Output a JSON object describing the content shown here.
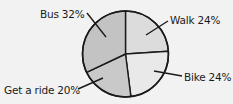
{
  "chart_data": {
    "type": "pie",
    "title": "",
    "categories": [
      "Walk",
      "Bike",
      "Get a ride",
      "Bus"
    ],
    "values": [
      24,
      24,
      20,
      32
    ],
    "unit": "%",
    "labels": [
      "Walk 24%",
      "Bike 24%",
      "Get a ride 20%",
      "Bus 32%"
    ],
    "colors": [
      "#dcdcdc",
      "#e9e9e9",
      "#c9c9c9",
      "#c3c3c3"
    ],
    "start_angle_deg": -90,
    "direction": "clockwise",
    "legend": "none (callout labels with leader lines)"
  },
  "labels": {
    "bus": "Bus 32%",
    "walk": "Walk 24%",
    "bike": "Bike 24%",
    "ride": "Get a ride 20%"
  }
}
